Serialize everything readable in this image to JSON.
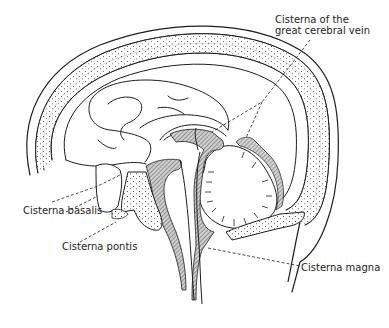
{
  "figure": {
    "labels": [
      {
        "id": "vein",
        "lines": [
          "Cisterna of the",
          "great cerebral vein"
        ]
      },
      {
        "id": "basalis",
        "lines": [
          "Cisterna basalis"
        ]
      },
      {
        "id": "pontis",
        "lines": [
          "Cisterna pontis"
        ]
      },
      {
        "id": "magna",
        "lines": [
          "Cisterna magna"
        ]
      }
    ]
  },
  "colors": {
    "ink": "#1e1e1e",
    "background": "#ffffff",
    "hatch": "#6a6a6a"
  }
}
